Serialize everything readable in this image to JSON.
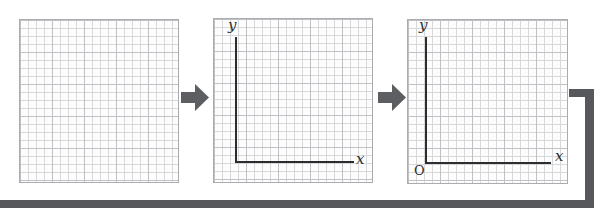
{
  "figure": {
    "panels": [
      {
        "id": "blank-grid",
        "type": "graph-paper",
        "labels": {}
      },
      {
        "id": "grid-with-axes",
        "type": "graph-paper-with-axes",
        "labels": {
          "y": "y",
          "x": "x"
        }
      },
      {
        "id": "grid-with-axes-and-origin",
        "type": "graph-paper-with-axes",
        "labels": {
          "y": "y",
          "x": "x",
          "origin": "O"
        }
      }
    ],
    "arrows": [
      {
        "id": "step-arrow-1",
        "direction": "right"
      },
      {
        "id": "step-arrow-2",
        "direction": "right"
      }
    ],
    "connector": {
      "shape": "elbow-down-to-bottom-bar"
    }
  },
  "colors": {
    "canvas_bg": "#ffffff",
    "panel_bg": "#fdfdfd",
    "grid_minor": "#d7d8da",
    "grid_major": "#c0c1c4",
    "panel_border": "#aaabae",
    "axis": "#2d2d2f",
    "label": "#2d2d2f",
    "arrow": "#5d5e61",
    "connector": "#57585b"
  }
}
